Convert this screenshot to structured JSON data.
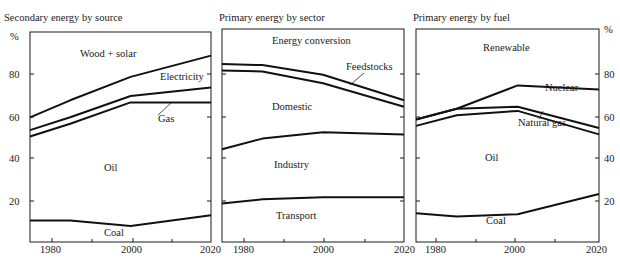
{
  "figure": {
    "y_unit_label": "%",
    "x_tick_labels": [
      "1980",
      "2000",
      "2020"
    ]
  },
  "chart_data": [
    {
      "type": "area",
      "title": "Secondary energy by source",
      "xlabel": "",
      "ylabel": "%",
      "x": [
        1975,
        1985,
        2000,
        2020
      ],
      "xlim": [
        1975,
        2020
      ],
      "ylim": [
        0,
        100
      ],
      "y_ticks": [
        20,
        40,
        60,
        80
      ],
      "y_axis_side": "left",
      "stacking": "cumulative boundaries (bands between lines)",
      "boundaries": [
        {
          "name": "Coal/Oil boundary",
          "values": [
            10.5,
            10.5,
            8,
            13
          ]
        },
        {
          "name": "Oil/Gas boundary",
          "values": [
            50,
            56,
            66,
            66
          ]
        },
        {
          "name": "Gas/Electricity boundary",
          "values": [
            53,
            59,
            69,
            73
          ]
        },
        {
          "name": "Electricity/Wood+solar boundary",
          "values": [
            59,
            67,
            78,
            88
          ]
        }
      ],
      "bands": [
        "Coal",
        "Oil",
        "Gas",
        "Electricity",
        "Wood + solar"
      ],
      "series": [
        {
          "name": "Coal",
          "values": [
            10.5,
            10.5,
            8,
            13
          ]
        },
        {
          "name": "Oil",
          "values": [
            39.5,
            45.5,
            58,
            53
          ]
        },
        {
          "name": "Gas",
          "values": [
            3,
            3,
            3,
            7
          ]
        },
        {
          "name": "Electricity",
          "values": [
            6,
            8,
            9,
            15
          ]
        },
        {
          "name": "Wood + solar",
          "values": [
            41,
            33,
            22,
            12
          ]
        }
      ],
      "annotations": [
        "Wood + solar",
        "Electricity",
        "Gas",
        "Oil",
        "Coal"
      ],
      "grid": false,
      "legend": "inline labels"
    },
    {
      "type": "area",
      "title": "Primary energy by sector",
      "xlabel": "",
      "ylabel": "%",
      "x": [
        1975,
        1985,
        2000,
        2020
      ],
      "xlim": [
        1975,
        2020
      ],
      "ylim": [
        0,
        100
      ],
      "y_ticks": [
        20,
        40,
        60,
        80
      ],
      "y_axis_side": "none (shared scale)",
      "stacking": "cumulative boundaries (bands between lines)",
      "boundaries": [
        {
          "name": "Transport/Industry boundary",
          "values": [
            18.5,
            20.5,
            21.5,
            21.5
          ]
        },
        {
          "name": "Industry/Domestic boundary",
          "values": [
            44,
            49,
            52,
            51
          ]
        },
        {
          "name": "Domestic/Feedstocks boundary",
          "values": [
            81,
            80.5,
            75,
            64
          ]
        },
        {
          "name": "Feedstocks/Energy conversion boundary",
          "values": [
            84,
            83.5,
            79,
            67
          ]
        }
      ],
      "bands": [
        "Transport",
        "Industry",
        "Domestic",
        "Feedstocks",
        "Energy conversion"
      ],
      "series": [
        {
          "name": "Transport",
          "values": [
            18.5,
            20.5,
            21.5,
            21.5
          ]
        },
        {
          "name": "Industry",
          "values": [
            25.5,
            28.5,
            30.5,
            29.5
          ]
        },
        {
          "name": "Domestic",
          "values": [
            37,
            31.5,
            23,
            13
          ]
        },
        {
          "name": "Feedstocks",
          "values": [
            3,
            3,
            4,
            3
          ]
        },
        {
          "name": "Energy conversion",
          "values": [
            16,
            16.5,
            21,
            33
          ]
        }
      ],
      "annotations": [
        "Energy conversion",
        "Feedstocks",
        "Domestic",
        "Industry",
        "Transport"
      ],
      "grid": false,
      "legend": "inline labels"
    },
    {
      "type": "area",
      "title": "Primary energy by fuel",
      "xlabel": "",
      "ylabel": "%",
      "x": [
        1975,
        1985,
        2000,
        2020
      ],
      "xlim": [
        1975,
        2020
      ],
      "ylim": [
        0,
        100
      ],
      "y_ticks": [
        20,
        40,
        60,
        80
      ],
      "y_axis_side": "right",
      "stacking": "cumulative boundaries (bands between lines)",
      "boundaries": [
        {
          "name": "Coal/Oil boundary",
          "values": [
            14,
            12.5,
            13.5,
            23
          ]
        },
        {
          "name": "Oil/Natural gas boundary",
          "values": [
            55,
            60,
            62,
            51
          ]
        },
        {
          "name": "Natural gas/Nuclear boundary",
          "values": [
            58,
            63,
            64,
            54
          ]
        },
        {
          "name": "Nuclear/Renewable boundary",
          "values": [
            58,
            63,
            74,
            72
          ]
        }
      ],
      "bands": [
        "Coal",
        "Oil",
        "Natural gas",
        "Nuclear",
        "Renewable"
      ],
      "series": [
        {
          "name": "Coal",
          "values": [
            14,
            12.5,
            13.5,
            23
          ]
        },
        {
          "name": "Oil",
          "values": [
            41,
            47.5,
            48.5,
            28
          ]
        },
        {
          "name": "Natural gas",
          "values": [
            3,
            3,
            2,
            3
          ]
        },
        {
          "name": "Nuclear",
          "values": [
            0,
            0,
            10,
            18
          ]
        },
        {
          "name": "Renewable",
          "values": [
            42,
            37,
            26,
            28
          ]
        }
      ],
      "annotations": [
        "Renewable",
        "Nuclear",
        "Natural gas",
        "Oil",
        "Coal"
      ],
      "grid": false,
      "legend": "inline labels"
    }
  ],
  "panels": [
    {
      "title": "Secondary energy by source",
      "labels": {
        "wood_solar": "Wood + solar",
        "electricity": "Electricity",
        "gas": "Gas",
        "oil": "Oil",
        "coal": "Coal"
      },
      "y_ticks": [
        "%",
        "80",
        "60",
        "40",
        "20"
      ],
      "x_ticks": [
        "1980",
        "2000",
        "2020"
      ]
    },
    {
      "title": "Primary energy by sector",
      "labels": {
        "energy_conversion": "Energy conversion",
        "feedstocks": "Feedstocks",
        "domestic": "Domestic",
        "industry": "Industry",
        "transport": "Transport"
      },
      "x_ticks": [
        "1980",
        "2000",
        "2020"
      ]
    },
    {
      "title": "Primary energy by fuel",
      "labels": {
        "renewable": "Renewable",
        "nuclear": "Nuclear",
        "natural_gas": "Natural gas",
        "oil": "Oil",
        "coal": "Coal"
      },
      "y_ticks": [
        "%",
        "80",
        "60",
        "40",
        "20"
      ],
      "x_ticks": [
        "1980",
        "2000",
        "2020"
      ]
    }
  ]
}
